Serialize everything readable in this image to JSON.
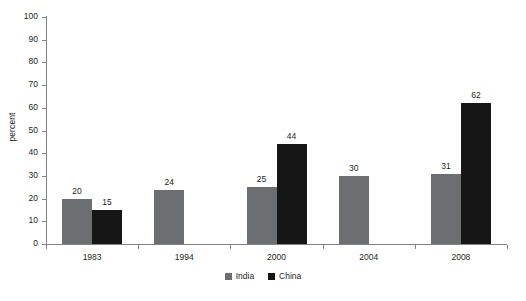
{
  "chart_data": {
    "type": "bar",
    "title": "",
    "xlabel": "",
    "ylabel": "percent",
    "categories": [
      "1983",
      "1994",
      "2000",
      "2004",
      "2008"
    ],
    "series": [
      {
        "name": "India",
        "color": "#6d6e71",
        "values": [
          20,
          24,
          25,
          30,
          31
        ]
      },
      {
        "name": "China",
        "color": "#161616",
        "values": [
          15,
          null,
          44,
          null,
          62
        ]
      }
    ],
    "ylim": [
      0,
      100
    ],
    "yticks": [
      0,
      10,
      20,
      30,
      40,
      50,
      60,
      70,
      80,
      90,
      100
    ],
    "ytick_labels": [
      "0",
      "10",
      "20",
      "30",
      "40",
      "50",
      "60",
      "70",
      "80",
      "90",
      "100"
    ],
    "grid": false,
    "legend_position": "bottom",
    "data_labels": {
      "1983": {
        "India": "20",
        "China": "15"
      },
      "1994": {
        "India": "24",
        "China": ""
      },
      "2000": {
        "India": "25",
        "China": "44"
      },
      "2004": {
        "India": "30",
        "China": ""
      },
      "2008": {
        "India": "31",
        "China": "62"
      }
    }
  },
  "legend": {
    "items": [
      {
        "label": "India",
        "color": "#6d6e71"
      },
      {
        "label": "China",
        "color": "#161616"
      }
    ]
  },
  "axis": {
    "y_title": "percent"
  }
}
